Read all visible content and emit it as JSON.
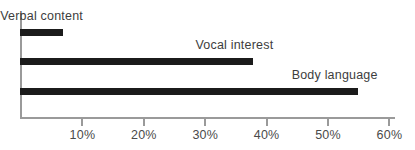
{
  "chart_data": {
    "type": "bar",
    "orientation": "horizontal",
    "title": "",
    "xlabel": "",
    "ylabel": "",
    "categories": [
      "Verbal content",
      "Vocal interest",
      "Body language"
    ],
    "values": [
      7,
      38,
      55
    ],
    "value_suffix": "%",
    "xlim": [
      0,
      62
    ],
    "xticks": [
      10,
      20,
      30,
      40,
      50,
      60
    ],
    "xtick_labels": [
      "10%",
      "20%",
      "30%",
      "40%",
      "50%",
      "60%"
    ],
    "grid": false,
    "legend": false,
    "bar_color": "#1b1b1b",
    "axis_color": "#9a9a9a",
    "label_color": "#3d3d3d",
    "background_color": "#ffffff",
    "labels_inline_above_bars": true
  }
}
